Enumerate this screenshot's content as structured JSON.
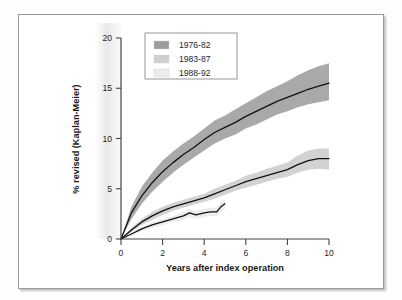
{
  "figure": {
    "border_color": "#9a9a9a",
    "background": "#ffffff"
  },
  "chart_data": {
    "type": "line",
    "title": "",
    "subtitle": "",
    "xlabel": "Years after index operation",
    "ylabel": "% revised (Kaplan-Meier)",
    "xlim": [
      0,
      10
    ],
    "ylim": [
      0,
      20
    ],
    "xticks": [
      0,
      2,
      4,
      6,
      8,
      10
    ],
    "yticks": [
      0,
      5,
      10,
      15,
      20
    ],
    "xtick_labels": [
      "0",
      "2",
      "4",
      "6",
      "8",
      "10"
    ],
    "ytick_labels": [
      "0",
      "5",
      "10",
      "15",
      "20"
    ],
    "grid": false,
    "legend_position": "top-left",
    "band_style": "confidence interval shading",
    "series": [
      {
        "name": "1976-82",
        "color": "#a9a9a9",
        "line_color": "#111111",
        "x": [
          0,
          0.5,
          1,
          1.5,
          2,
          2.5,
          3,
          3.5,
          4,
          4.5,
          5,
          5.5,
          6,
          6.5,
          7,
          7.5,
          8,
          8.5,
          9,
          9.5,
          10
        ],
        "values": [
          0,
          2.6,
          4.3,
          5.6,
          6.7,
          7.6,
          8.4,
          9.1,
          9.9,
          10.6,
          11.1,
          11.6,
          12.2,
          12.7,
          13.2,
          13.7,
          14.1,
          14.5,
          14.9,
          15.2,
          15.5
        ],
        "lower": [
          0,
          2.0,
          3.5,
          4.7,
          5.7,
          6.6,
          7.4,
          8.1,
          8.8,
          9.5,
          10.0,
          10.4,
          11.0,
          11.4,
          11.9,
          12.4,
          12.7,
          13.1,
          13.4,
          13.6,
          13.8
        ],
        "upper": [
          0,
          3.2,
          5.2,
          6.6,
          7.8,
          8.7,
          9.5,
          10.2,
          11.0,
          11.8,
          12.3,
          12.9,
          13.5,
          14.1,
          14.7,
          15.2,
          15.7,
          16.3,
          16.8,
          17.2,
          17.5
        ]
      },
      {
        "name": "1983-87",
        "color": "#d2d2d2",
        "line_color": "#111111",
        "x": [
          0,
          0.5,
          1,
          1.5,
          2,
          2.5,
          3,
          3.5,
          4,
          4.5,
          5,
          5.5,
          6,
          6.5,
          7,
          7.5,
          8,
          8.5,
          9,
          9.5,
          10
        ],
        "values": [
          0,
          0.9,
          1.7,
          2.3,
          2.8,
          3.2,
          3.5,
          3.8,
          4.1,
          4.5,
          4.9,
          5.3,
          5.7,
          6.0,
          6.3,
          6.6,
          6.9,
          7.4,
          7.8,
          8.0,
          8.0
        ],
        "lower": [
          0,
          0.7,
          1.4,
          1.9,
          2.4,
          2.8,
          3.1,
          3.4,
          3.7,
          4.0,
          4.4,
          4.8,
          5.1,
          5.4,
          5.7,
          6.0,
          6.2,
          6.6,
          6.9,
          7.0,
          6.9
        ],
        "upper": [
          0,
          1.1,
          2.0,
          2.7,
          3.2,
          3.6,
          3.9,
          4.2,
          4.5,
          5.0,
          5.4,
          5.8,
          6.3,
          6.6,
          7.0,
          7.3,
          7.6,
          8.3,
          8.8,
          9.0,
          9.0
        ]
      },
      {
        "name": "1988-92",
        "color": "#ededed",
        "line_color": "#111111",
        "x": [
          0,
          0.5,
          1,
          1.5,
          2,
          2.5,
          3,
          3.3,
          3.6,
          4,
          4.3,
          4.6,
          4.8,
          5.0
        ],
        "values": [
          0,
          0.5,
          1.0,
          1.4,
          1.7,
          2.0,
          2.3,
          2.6,
          2.4,
          2.6,
          2.7,
          2.7,
          3.2,
          3.5
        ],
        "lower": [
          0,
          0.4,
          0.8,
          1.1,
          1.4,
          1.7,
          1.9,
          2.2,
          2.0,
          2.2,
          2.3,
          2.3,
          2.7,
          3.0
        ],
        "upper": [
          0,
          0.6,
          1.2,
          1.7,
          2.0,
          2.3,
          2.7,
          3.0,
          2.8,
          3.0,
          3.1,
          3.1,
          3.7,
          4.0
        ]
      }
    ]
  },
  "legend": {
    "items": [
      {
        "label": "1976-82",
        "swatch": "#9c9c9c"
      },
      {
        "label": "1983-87",
        "swatch": "#d0d0d0"
      },
      {
        "label": "1988-92",
        "swatch": "#ececec"
      }
    ]
  }
}
